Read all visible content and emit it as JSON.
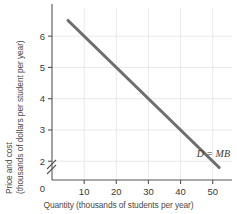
{
  "chart_data": {
    "type": "line",
    "title": "",
    "subtitle": "",
    "xlabel": "Quantity (thousands of students per year)",
    "ylabel": "Price and cost (thousands of dollars per student per year)",
    "ylabel_line1": "Price and cost",
    "ylabel_line2": "(thousands of dollars per student per year)",
    "xlim": [
      0,
      56
    ],
    "ylim": [
      1.4,
      6.9
    ],
    "y_axis_break": true,
    "y_axis_break_note": "axis break between 0 and 2",
    "grid": true,
    "legend_position": "inline-right",
    "xticks": [
      0,
      10,
      20,
      30,
      40,
      50
    ],
    "xticklabels": [
      "0",
      "10",
      "20",
      "30",
      "40",
      "50"
    ],
    "yticks": [
      2,
      3,
      4,
      5,
      6
    ],
    "yticklabels": [
      "2",
      "3",
      "4",
      "5",
      "6"
    ],
    "y_origin_label": "0",
    "series": [
      {
        "name": "D = MB",
        "label": "D = MB",
        "color": "#6e6e6e",
        "x": [
          5,
          52
        ],
        "y": [
          6.5,
          1.8
        ],
        "points": [
          {
            "x": 5,
            "y": 6.5
          },
          {
            "x": 10,
            "y": 6.0
          },
          {
            "x": 20,
            "y": 5.0
          },
          {
            "x": 30,
            "y": 4.0
          },
          {
            "x": 40,
            "y": 3.0
          },
          {
            "x": 50,
            "y": 2.0
          },
          {
            "x": 52,
            "y": 1.8
          }
        ]
      }
    ],
    "annotations": [
      {
        "text": "D = MB",
        "x": 45,
        "y": 2.15,
        "style": "italic"
      }
    ],
    "colors": {
      "curve": "#6e6e6e",
      "axis": "#555555",
      "grid": "#dfdfdf",
      "text": "#3a3a3a",
      "background": "#ffffff"
    }
  }
}
